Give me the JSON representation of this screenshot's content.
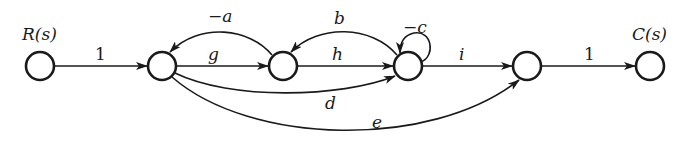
{
  "diagram": {
    "type": "signal-flow-graph",
    "nodes": [
      {
        "id": "R",
        "label": "R(s)",
        "cx": 40,
        "cy": 66
      },
      {
        "id": "n2",
        "label": "",
        "cx": 162,
        "cy": 66
      },
      {
        "id": "n3",
        "label": "",
        "cx": 283,
        "cy": 66
      },
      {
        "id": "n4",
        "label": "",
        "cx": 408,
        "cy": 66
      },
      {
        "id": "n5",
        "label": "",
        "cx": 527,
        "cy": 66
      },
      {
        "id": "C",
        "label": "C(s)",
        "cx": 650,
        "cy": 66
      }
    ],
    "edges": [
      {
        "from": "R",
        "to": "n2",
        "gain": "1"
      },
      {
        "from": "n2",
        "to": "n3",
        "gain": "g"
      },
      {
        "from": "n3",
        "to": "n2",
        "gain": "−a"
      },
      {
        "from": "n3",
        "to": "n4",
        "gain": "h"
      },
      {
        "from": "n4",
        "to": "n3",
        "gain": "b"
      },
      {
        "from": "n4",
        "to": "n4",
        "gain": "−c"
      },
      {
        "from": "n4",
        "to": "n5",
        "gain": "i"
      },
      {
        "from": "n2",
        "to": "n4",
        "gain": "d"
      },
      {
        "from": "n2",
        "to": "n5",
        "gain": "e"
      },
      {
        "from": "n5",
        "to": "C",
        "gain": "1"
      }
    ]
  },
  "labels": {
    "input": "R(s)",
    "output": "C(s)",
    "gain_R_n2": "1",
    "gain_g": "g",
    "gain_neg_a": "−a",
    "gain_h": "h",
    "gain_b": "b",
    "gain_neg_c": "−c",
    "gain_i": "i",
    "gain_d": "d",
    "gain_e": "e",
    "gain_n5_C": "1"
  }
}
